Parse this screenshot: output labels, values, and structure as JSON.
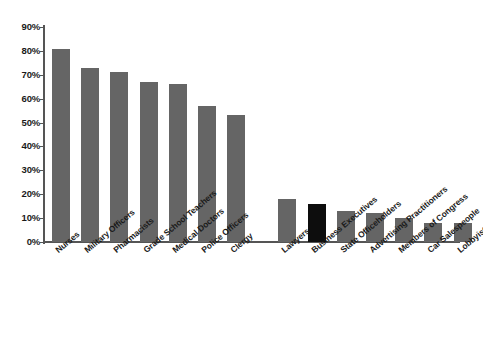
{
  "chart_data": {
    "type": "bar",
    "title": "",
    "subtitle": "",
    "xlabel": "",
    "ylabel": "",
    "ylim": [
      0,
      90
    ],
    "grid": false,
    "legend": "none",
    "y_tick_labels": [
      "90%",
      "80%",
      "70%",
      "60%",
      "50%",
      "40%",
      "30%",
      "20%",
      "10%",
      "0%"
    ],
    "y_tick_values": [
      90,
      80,
      70,
      60,
      50,
      40,
      30,
      20,
      10,
      0
    ],
    "categories": [
      "Nurses",
      "Military Officers",
      "Pharmacists",
      "Grade School Teachers",
      "Medical Doctors",
      "Police Officers",
      "Clergy",
      "Lawyers",
      "Business Executives",
      "State Officeholders",
      "Advertising Practitioners",
      "Members of Congress",
      "Car Salespeople",
      "Lobbyists"
    ],
    "values": [
      81,
      73,
      71,
      67,
      66,
      57,
      53,
      18,
      16,
      13,
      12,
      10,
      8,
      8
    ],
    "highlight_index": 8,
    "colors": {
      "bar": "#656565",
      "bar_highlight": "#0d0d0d",
      "axis": "#555555",
      "text": "#1a1a1a",
      "background": "#ffffff"
    },
    "group_gap_after_index": 6
  },
  "axis": {
    "y_unit": "percent",
    "y_max_label": "90%",
    "y_min_label": "0%"
  }
}
